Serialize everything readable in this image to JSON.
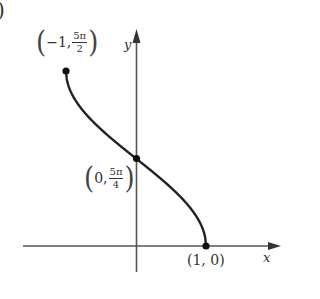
{
  "panel_label": ")",
  "axes": {
    "x_label": "x",
    "y_label": "y"
  },
  "points": [
    {
      "name": "start",
      "x_text": "−1,",
      "frac_num": "5π",
      "frac_den": "2"
    },
    {
      "name": "mid",
      "x_text": "0,",
      "frac_num": "5π",
      "frac_den": "4"
    },
    {
      "name": "end",
      "text": "(1, 0)"
    }
  ],
  "colors": {
    "curve": "#222222",
    "axis": "#555555",
    "text": "#333333"
  },
  "chart_data": {
    "type": "line",
    "title": "",
    "function": "y = (5/2)·arccos(x)",
    "xlabel": "x",
    "ylabel": "y",
    "xlim": [
      -1,
      1
    ],
    "ylim": [
      0,
      7.854
    ],
    "grid": false,
    "legend": null,
    "series": [
      {
        "name": "y = (5/2) arccos x",
        "x": [
          -1,
          -0.75,
          -0.5,
          -0.25,
          0,
          0.25,
          0.5,
          0.75,
          1
        ],
        "y": [
          7.854,
          6.046,
          5.236,
          4.559,
          3.927,
          3.295,
          2.618,
          1.808,
          0
        ]
      }
    ],
    "annotations": [
      {
        "x": -1,
        "y": 7.854,
        "text": "(−1, 5π/2)"
      },
      {
        "x": 0,
        "y": 3.927,
        "text": "(0, 5π/4)"
      },
      {
        "x": 1,
        "y": 0,
        "text": "(1, 0)"
      }
    ]
  }
}
